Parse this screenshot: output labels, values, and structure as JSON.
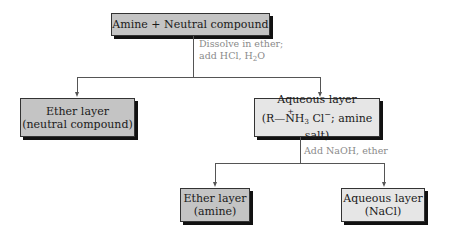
{
  "diagram": {
    "root": {
      "label": "Amine + Neutral compound"
    },
    "step1": {
      "line1": "Dissolve in ether;",
      "line2_prefix": "add HCl, H",
      "line2_sub": "2",
      "line2_suffix": "O"
    },
    "left1": {
      "line1": "Ether layer",
      "line2": "(neutral compound)"
    },
    "right1": {
      "line1": "Aqueous layer",
      "formula_open": "(R",
      "formula_bond": "—",
      "formula_n": "N",
      "formula_plus": "+",
      "formula_h": "H",
      "formula_h_sub": "3",
      "formula_cl": " Cl",
      "formula_cl_sup": "−",
      "formula_rest": "; amine salt)"
    },
    "step2": {
      "label": "Add NaOH, ether"
    },
    "left2": {
      "line1": "Ether layer",
      "line2": "(amine)"
    },
    "right2": {
      "line1": "Aqueous layer",
      "line2": "(NaCl)"
    },
    "colors": {
      "dark_box": "#c4c4c4",
      "light_box": "#e6e6e6",
      "note_text": "#8a8a8a",
      "line": "#555555"
    }
  }
}
